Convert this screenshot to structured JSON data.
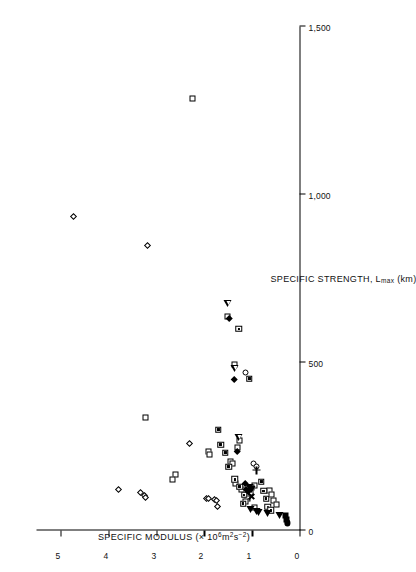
{
  "chart_data": {
    "type": "scatter",
    "title": "",
    "orientation": "rotated-90-ccw",
    "xlabel": "SPECIFIC STRENGTH, L",
    "xlabel_sub": "max",
    "xlabel_units": " (km)",
    "ylabel": "SPECIFIC MODULUS (× 10",
    "ylabel_sup1": "6",
    "ylabel_mid": "m",
    "ylabel_sup2": "2",
    "ylabel_mid2": "s",
    "ylabel_sup3": "−2",
    "ylabel_end": ")",
    "xlim": [
      0,
      1500
    ],
    "ylim": [
      0,
      5.5
    ],
    "xticks": [
      0,
      500,
      1000,
      1500
    ],
    "xticklabels": [
      "0",
      "500",
      "1,000",
      "1,500"
    ],
    "yticks": [
      0,
      1,
      2,
      3,
      4,
      5
    ],
    "yticklabels": [
      "0",
      "1",
      "2",
      "3",
      "4",
      "5"
    ],
    "grid": false,
    "legend": "none",
    "series": [
      {
        "name": "open-square",
        "marker": "m-open-square",
        "points": [
          [
            1285,
            2.24
          ],
          [
            637,
            1.5
          ],
          [
            493,
            1.36
          ],
          [
            335,
            3.22
          ],
          [
            268,
            1.25
          ],
          [
            248,
            1.3
          ],
          [
            236,
            1.9
          ],
          [
            225,
            1.88
          ],
          [
            206,
            1.45
          ],
          [
            200,
            1.4
          ],
          [
            166,
            2.6
          ],
          [
            152,
            2.66
          ],
          [
            140,
            1.33
          ],
          [
            133,
            0.95
          ],
          [
            128,
            1.0
          ],
          [
            122,
            1.22
          ],
          [
            120,
            0.62
          ],
          [
            112,
            1.02
          ],
          [
            108,
            0.58
          ],
          [
            96,
            1.08
          ],
          [
            90,
            0.55
          ],
          [
            85,
            1.12
          ],
          [
            76,
            0.48
          ],
          [
            68,
            0.95
          ]
        ]
      },
      {
        "name": "dot-square",
        "marker": "m-dot-square",
        "points": [
          [
            600,
            1.27
          ],
          [
            452,
            1.05
          ],
          [
            300,
            1.7
          ],
          [
            255,
            1.65
          ],
          [
            232,
            1.55
          ],
          [
            190,
            1.48
          ],
          [
            152,
            1.35
          ],
          [
            145,
            0.8
          ],
          [
            130,
            1.25
          ],
          [
            118,
            0.75
          ],
          [
            106,
            1.16
          ],
          [
            95,
            0.7
          ],
          [
            80,
            1.18
          ],
          [
            70,
            0.66
          ],
          [
            60,
            0.6
          ]
        ]
      },
      {
        "name": "filled-square",
        "marker": "m-filled-square",
        "points": [
          [
            46,
            0.3
          ],
          [
            34,
            0.28
          ]
        ]
      },
      {
        "name": "open-circle",
        "marker": "m-open-circle",
        "points": [
          [
            470,
            1.12
          ],
          [
            198,
            0.96
          ],
          [
            190,
            0.9
          ]
        ]
      },
      {
        "name": "filled-circle",
        "marker": "m-filled-circle",
        "points": [
          [
            22,
            0.26
          ]
        ]
      },
      {
        "name": "open-diamond",
        "marker": "m-open-diamond",
        "points": [
          [
            935,
            4.72
          ],
          [
            848,
            3.18
          ],
          [
            258,
            2.3
          ],
          [
            122,
            3.78
          ],
          [
            112,
            3.32
          ],
          [
            105,
            3.25
          ],
          [
            98,
            3.22
          ],
          [
            96,
            1.94
          ],
          [
            94,
            1.9
          ],
          [
            92,
            1.78
          ],
          [
            88,
            1.74
          ],
          [
            70,
            1.72
          ]
        ]
      },
      {
        "name": "filled-diamond",
        "marker": "m-filled-diamond",
        "points": [
          [
            632,
            1.47
          ],
          [
            450,
            1.36
          ],
          [
            236,
            1.3
          ],
          [
            140,
            1.12
          ],
          [
            122,
            1.1
          ],
          [
            116,
            1.06
          ]
        ]
      },
      {
        "name": "open-triangle-left",
        "marker": "m-open-triangle",
        "points": [
          [
            675,
            1.5
          ],
          [
            482,
            1.36
          ],
          [
            278,
            1.28
          ]
        ]
      },
      {
        "name": "filled-triangle-left",
        "marker": "m-filled-triangle",
        "points": [
          [
            122,
            1.0
          ],
          [
            62,
            1.02
          ],
          [
            58,
            0.9
          ],
          [
            55,
            0.86
          ],
          [
            50,
            0.66
          ],
          [
            44,
            0.42
          ],
          [
            128,
            1.04
          ]
        ]
      },
      {
        "name": "plus",
        "marker": "m-plus",
        "points": [
          [
            180,
            0.9
          ]
        ]
      },
      {
        "name": "cross",
        "marker": "m-cross",
        "points": [
          [
            100,
            1.0
          ]
        ]
      }
    ]
  }
}
